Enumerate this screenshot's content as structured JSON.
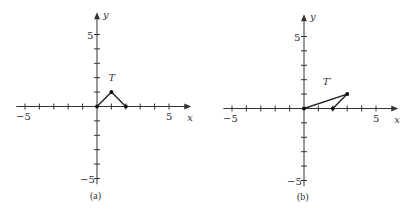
{
  "figure": {
    "panels": [
      {
        "id": "a",
        "caption": "(a)",
        "shape_label": "T",
        "x_axis_label": "x",
        "y_axis_label": "y",
        "tick_labels": {
          "x_min": "−5",
          "x_max": "5",
          "y_max": "5",
          "y_min": "−5"
        },
        "axis_range": {
          "x": [
            -5,
            5
          ],
          "y": [
            -5,
            5
          ]
        },
        "vertices": [
          [
            0,
            0
          ],
          [
            1,
            1
          ],
          [
            2,
            0
          ]
        ],
        "layout": {
          "ox": 97,
          "oy": 106.5,
          "unit": 14.4
        }
      },
      {
        "id": "b",
        "caption": "(b)",
        "shape_label": "T′",
        "x_axis_label": "x",
        "y_axis_label": "y",
        "tick_labels": {
          "x_min": "−5",
          "x_max": "5",
          "y_max": "5",
          "y_min": "−5"
        },
        "axis_range": {
          "x": [
            -5,
            5
          ],
          "y": [
            -5,
            5
          ]
        },
        "vertices": [
          [
            0,
            0
          ],
          [
            3,
            1
          ],
          [
            2,
            0
          ]
        ],
        "layout": {
          "ox": 99,
          "oy": 108.5,
          "unit": 14.4
        }
      }
    ],
    "colors": {
      "ink": "#222222",
      "axis": "#333333",
      "background": "#ffffff"
    }
  }
}
